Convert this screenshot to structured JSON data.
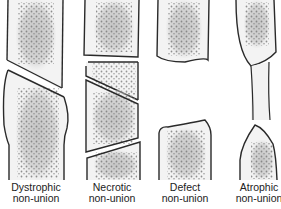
{
  "figure": {
    "panels": [
      {
        "id": "dystrophic",
        "label_line1": "Dystrophic",
        "label_line2": "non-union"
      },
      {
        "id": "necrotic",
        "label_line1": "Necrotic",
        "label_line2": "non-union"
      },
      {
        "id": "defect",
        "label_line1": "Defect",
        "label_line2": "non-union"
      },
      {
        "id": "atrophic",
        "label_line1": "Atrophic",
        "label_line2": "non-union"
      }
    ],
    "colors": {
      "outline": "#2a2a2a",
      "bone_fill": "#f3f3f3",
      "marrow": "#cfcfcf",
      "dots": "#8a8a8a"
    }
  }
}
